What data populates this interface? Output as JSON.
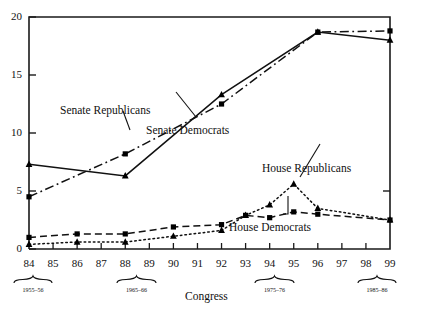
{
  "axis": {
    "xlabel": "Congress",
    "ylabel": "",
    "ytick_labels": [
      "0",
      "5",
      "10",
      "15",
      "20"
    ],
    "xtick_labels": [
      "84",
      "85",
      "86",
      "87",
      "88",
      "89",
      "90",
      "91",
      "92",
      "93",
      "94",
      "95",
      "96",
      "97",
      "98",
      "99"
    ]
  },
  "era_brackets": [
    {
      "label": "1955–56",
      "center": "84"
    },
    {
      "label": "1965–66",
      "center": "89"
    },
    {
      "label": "1975–76",
      "center": "94"
    },
    {
      "label": "1985–86",
      "center": "99"
    }
  ],
  "series_labels": {
    "senate_republicans": "Senate Republicans",
    "senate_democrats": "Senate Democrats",
    "house_republicans": "House Republicans",
    "house_democrats": "House Democrats"
  },
  "chart_data": {
    "type": "line",
    "title": "",
    "xlabel": "Congress",
    "ylabel": "",
    "xlim": [
      84,
      99
    ],
    "ylim": [
      0,
      20
    ],
    "yticks": [
      0,
      5,
      10,
      15,
      20
    ],
    "xticks": [
      84,
      85,
      86,
      87,
      88,
      89,
      90,
      91,
      92,
      93,
      94,
      95,
      96,
      97,
      98,
      99
    ],
    "grid": false,
    "legend": "inline-annotations",
    "x": [
      84,
      86,
      88,
      90,
      92,
      93,
      94,
      95,
      96,
      99
    ],
    "series": [
      {
        "name": "Senate Republicans",
        "marker": "square",
        "linestyle": "dashdot",
        "x": [
          84,
          88,
          92,
          96,
          99
        ],
        "values": [
          4.5,
          8.2,
          12.5,
          18.7,
          18.8
        ]
      },
      {
        "name": "Senate Democrats",
        "marker": "triangle",
        "linestyle": "solid",
        "x": [
          84,
          88,
          92,
          96,
          99
        ],
        "values": [
          7.3,
          6.3,
          13.3,
          18.7,
          18.0
        ]
      },
      {
        "name": "House Republicans",
        "marker": "triangle",
        "linestyle": "dotted",
        "x": [
          84,
          86,
          88,
          90,
          92,
          93,
          94,
          95,
          96,
          99
        ],
        "values": [
          0.4,
          0.6,
          0.6,
          1.1,
          1.6,
          2.9,
          3.8,
          5.6,
          3.5,
          2.5
        ]
      },
      {
        "name": "House Democrats",
        "marker": "square",
        "linestyle": "dashed",
        "x": [
          84,
          86,
          88,
          90,
          92,
          93,
          94,
          95,
          96,
          99
        ],
        "values": [
          1.0,
          1.3,
          1.3,
          1.9,
          2.1,
          2.9,
          2.7,
          3.2,
          3.0,
          2.5
        ]
      }
    ],
    "era_brackets": [
      {
        "label": "1955–56",
        "span": [
          84,
          85
        ]
      },
      {
        "label": "1965–66",
        "span": [
          88,
          90
        ]
      },
      {
        "label": "1975–76",
        "span": [
          93,
          94
        ]
      },
      {
        "label": "1985–86",
        "span": [
          98,
          99
        ]
      }
    ]
  }
}
